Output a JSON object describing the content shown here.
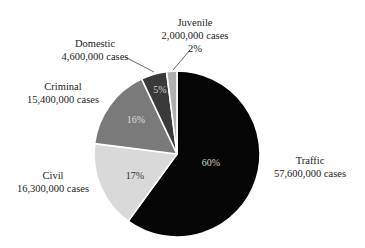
{
  "chart_data": {
    "type": "pie",
    "title": "",
    "start_angle_deg": 0,
    "direction": "clockwise",
    "slices": [
      {
        "name": "Traffic",
        "cases": 57600000,
        "cases_label": "57,600,000 cases",
        "percent": 60,
        "percent_label": "60%",
        "color": "#050505",
        "text_color": "#d0d0d0"
      },
      {
        "name": "Civil",
        "cases": 16300000,
        "cases_label": "16,300,000 cases",
        "percent": 17,
        "percent_label": "17%",
        "color": "#d9d9d9",
        "text_color": "#333333"
      },
      {
        "name": "Criminal",
        "cases": 15400000,
        "cases_label": "15,400,000 cases",
        "percent": 16,
        "percent_label": "16%",
        "color": "#7a7a7a",
        "text_color": "#dddddd"
      },
      {
        "name": "Domestic",
        "cases": 4600000,
        "cases_label": "4,600,000 cases",
        "percent": 5,
        "percent_label": "5%",
        "color": "#3a3a3a",
        "text_color": "#cccccc"
      },
      {
        "name": "Juvenile",
        "cases": 2000000,
        "cases_label": "2,000,000 cases",
        "percent": 2,
        "percent_label": "2%",
        "color": "#b0b0b0",
        "text_color": "#333333"
      }
    ]
  },
  "labels": {
    "traffic": {
      "name": "Traffic",
      "cases": "57,600,000 cases"
    },
    "civil": {
      "name": "Civil",
      "cases": "16,300,000 cases"
    },
    "criminal": {
      "name": "Criminal",
      "cases": "15,400,000 cases"
    },
    "domestic": {
      "name": "Domestic",
      "cases": "4,600,000 cases"
    },
    "juvenile": {
      "name": "Juvenile",
      "cases": "2,000,000 cases",
      "percent": "2%"
    }
  },
  "percents": {
    "traffic": "60%",
    "civil": "17%",
    "criminal": "16%",
    "domestic": "5%"
  }
}
